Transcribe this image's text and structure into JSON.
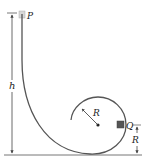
{
  "labels": {
    "start_point": "P",
    "height": "h",
    "radius": "R",
    "block": "Q",
    "block_height": "R"
  },
  "colors": {
    "track": "#555555",
    "ground": "#777777",
    "dimension": "#444444",
    "block_p": "#d8d8d8",
    "block_q": "#555555",
    "text": "#222222"
  }
}
